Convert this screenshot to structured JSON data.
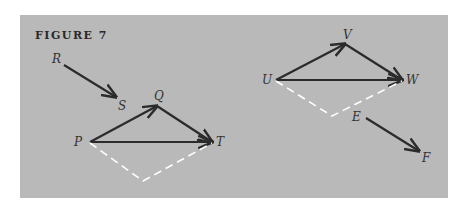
{
  "figure": {
    "title": "FIGURE 7",
    "colors": {
      "background": "#b9b9b9",
      "arrow": "#2b2b2b",
      "dashed": "#ffffff",
      "page": "#ffffff"
    }
  },
  "points": {
    "R": {
      "label": "R",
      "x": 64,
      "y": 65
    },
    "S": {
      "label": "S",
      "x": 116,
      "y": 98
    },
    "Q": {
      "label": "Q",
      "x": 158,
      "y": 105
    },
    "P": {
      "label": "P",
      "x": 90,
      "y": 142
    },
    "T": {
      "label": "T",
      "x": 213,
      "y": 142
    },
    "V": {
      "label": "V",
      "x": 347,
      "y": 44
    },
    "U": {
      "label": "U",
      "x": 276,
      "y": 80
    },
    "W": {
      "label": "W",
      "x": 402,
      "y": 80
    },
    "E": {
      "label": "E",
      "x": 366,
      "y": 117
    },
    "F": {
      "label": "F",
      "x": 418,
      "y": 152
    }
  },
  "vectors": [
    {
      "from": "R",
      "to": "S"
    },
    {
      "from": "P",
      "to": "Q"
    },
    {
      "from": "Q",
      "to": "T"
    },
    {
      "from": "P",
      "to": "T"
    },
    {
      "from": "U",
      "to": "V"
    },
    {
      "from": "V",
      "to": "W"
    },
    {
      "from": "U",
      "to": "W"
    },
    {
      "from": "E",
      "to": "F"
    }
  ],
  "dashed_paths": [
    [
      "P",
      "bottom1",
      "T"
    ],
    [
      "U",
      "bottom2",
      "W"
    ]
  ]
}
